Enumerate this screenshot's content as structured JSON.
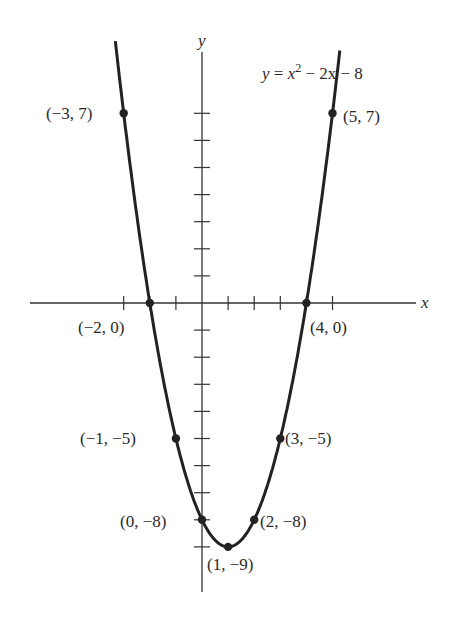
{
  "chart_data": {
    "type": "line",
    "equation": {
      "lhs": "y",
      "eq": " = ",
      "x": "x",
      "exp": "2",
      "rest": " − 2x − 8"
    },
    "xlabel": "x",
    "ylabel": "y",
    "xlim": [
      -4,
      7
    ],
    "ylim": [
      -10,
      9
    ],
    "grid": false,
    "x_ticks": [
      -3,
      -2,
      -1,
      0,
      1,
      2,
      3,
      4,
      5
    ],
    "y_ticks": [
      -9,
      -8,
      -7,
      -6,
      -5,
      -4,
      -3,
      -2,
      -1,
      1,
      2,
      3,
      4,
      5,
      6,
      7
    ],
    "series": [
      {
        "name": "y = x^2 - 2x - 8",
        "x": [
          -3,
          -2,
          -1,
          0,
          1,
          2,
          3,
          4,
          5
        ],
        "y": [
          7,
          0,
          -5,
          -8,
          -9,
          -8,
          -5,
          0,
          7
        ]
      }
    ],
    "points": [
      {
        "x": -3,
        "y": 7,
        "label": "(−3, 7)"
      },
      {
        "x": -2,
        "y": 0,
        "label": "(−2, 0)"
      },
      {
        "x": -1,
        "y": -5,
        "label": "(−1, −5)"
      },
      {
        "x": 0,
        "y": -8,
        "label": "(0, −8)"
      },
      {
        "x": 1,
        "y": -9,
        "label": "(1, −9)"
      },
      {
        "x": 2,
        "y": -8,
        "label": "(2, −8)"
      },
      {
        "x": 3,
        "y": -5,
        "label": "(3, −5)"
      },
      {
        "x": 4,
        "y": 0,
        "label": "(4, 0)"
      },
      {
        "x": 5,
        "y": 7,
        "label": "(5, 7)"
      }
    ]
  },
  "colors": {
    "curve": "#222222",
    "axis": "#333333",
    "text": "#2a2a2a"
  }
}
